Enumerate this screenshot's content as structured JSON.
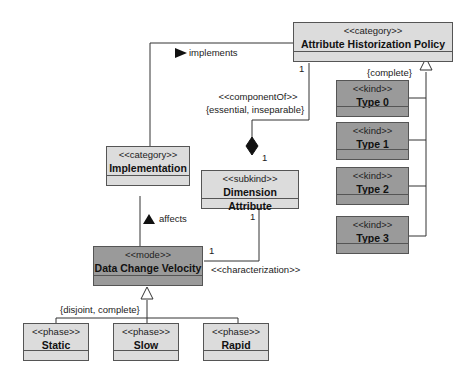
{
  "diagram": {
    "colors": {
      "light_fill": "#dcdcdc",
      "dark_fill": "#9a9a9a",
      "line": "#333333"
    },
    "classes": {
      "ahp": {
        "stereotype": "<<category>>",
        "name": "Attribute Historization Policy"
      },
      "impl": {
        "stereotype": "<<category>>",
        "name": "Implementation"
      },
      "dim": {
        "stereotype": "<<subkind>>",
        "name": "Dimension Attribute"
      },
      "dcv": {
        "stereotype": "<<mode>>",
        "name": "Data Change Velocity"
      },
      "type0": {
        "stereotype": "<<kind>>",
        "name": "Type 0"
      },
      "type1": {
        "stereotype": "<<kind>>",
        "name": "Type 1"
      },
      "type2": {
        "stereotype": "<<kind>>",
        "name": "Type 2"
      },
      "type3": {
        "stereotype": "<<kind>>",
        "name": "Type 3"
      },
      "static": {
        "stereotype": "<<phase>>",
        "name": "Static"
      },
      "slow": {
        "stereotype": "<<phase>>",
        "name": "Slow"
      },
      "rapid": {
        "stereotype": "<<phase>>",
        "name": "Rapid"
      }
    },
    "labels": {
      "implements": "implements",
      "affects": "affects",
      "component_of": "<<componentOf>>",
      "essential": "{essential, inseparable}",
      "characterization": "<<characterization>>",
      "complete": "{complete}",
      "disjoint_complete": "{disjoint, complete}",
      "mult_ahp": "1",
      "mult_dim_top": "1",
      "mult_dim_bottom": "1",
      "mult_dcv": "1"
    }
  }
}
